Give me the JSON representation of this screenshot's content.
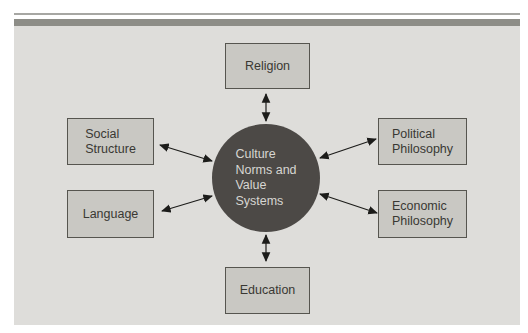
{
  "colors": {
    "page_bg": "#ffffff",
    "panel_bg": "#deddda",
    "top_thin_rule": "#a7a7a3",
    "top_band": "#8d8d87",
    "box_fill": "#c9c8c3",
    "box_border": "#56554f",
    "box_text": "#393833",
    "circle_fill": "#4c4946",
    "circle_text": "#d7d6d2",
    "arrow": "#1c1c1a"
  },
  "diagram": {
    "center": {
      "label": "Culture Norms and Value Systems",
      "lines": [
        "Culture",
        "Norms and",
        "Value",
        "Systems"
      ]
    },
    "nodes": [
      {
        "id": "religion",
        "label": "Religion",
        "lines": [
          "Religion"
        ],
        "position": "top"
      },
      {
        "id": "social-structure",
        "label": "Social Structure",
        "lines": [
          "Social",
          "Structure"
        ],
        "position": "upper-left"
      },
      {
        "id": "language",
        "label": "Language",
        "lines": [
          "Language"
        ],
        "position": "lower-left"
      },
      {
        "id": "political-philosophy",
        "label": "Political Philosophy",
        "lines": [
          "Political",
          "Philosophy"
        ],
        "position": "upper-right"
      },
      {
        "id": "economic-philosophy",
        "label": "Economic Philosophy",
        "lines": [
          "Economic",
          "Philosophy"
        ],
        "position": "lower-right"
      },
      {
        "id": "education",
        "label": "Education",
        "lines": [
          "Education"
        ],
        "position": "bottom"
      }
    ],
    "connections": [
      {
        "from": "culture-norms-and-value-systems",
        "to": "religion",
        "bidirectional": true
      },
      {
        "from": "culture-norms-and-value-systems",
        "to": "social-structure",
        "bidirectional": true
      },
      {
        "from": "culture-norms-and-value-systems",
        "to": "language",
        "bidirectional": true
      },
      {
        "from": "culture-norms-and-value-systems",
        "to": "political-philosophy",
        "bidirectional": true
      },
      {
        "from": "culture-norms-and-value-systems",
        "to": "economic-philosophy",
        "bidirectional": true
      },
      {
        "from": "culture-norms-and-value-systems",
        "to": "education",
        "bidirectional": true
      }
    ]
  }
}
